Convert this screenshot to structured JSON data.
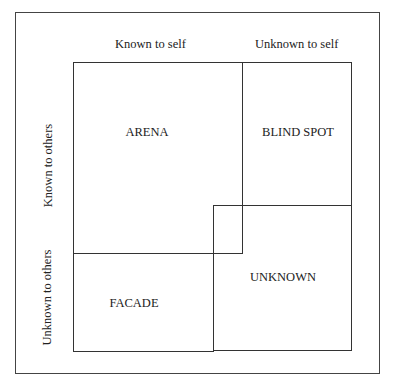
{
  "diagram": {
    "column_headers": [
      "Known to self",
      "Unknown to self"
    ],
    "row_headers": [
      "Known to others",
      "Unknown to others"
    ],
    "quadrants": {
      "arena": "ARENA",
      "blind_spot": "BLIND SPOT",
      "facade": "FACADE",
      "unknown": "UNKNOWN"
    }
  }
}
